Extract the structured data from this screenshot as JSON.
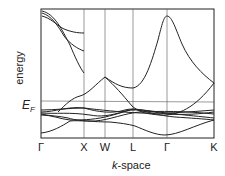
{
  "diagram": {
    "title": "",
    "y_axis_label": "energy",
    "fermi_label_main": "E",
    "fermi_label_sub": "F",
    "x_axis_label_italic": "k",
    "x_axis_label_rest": "-space",
    "k_points": [
      {
        "label": "Γ",
        "x": 41
      },
      {
        "label": "X",
        "x": 84
      },
      {
        "label": "W",
        "x": 105
      },
      {
        "label": "L",
        "x": 133
      },
      {
        "label": "Γ",
        "x": 167
      },
      {
        "label": "K",
        "x": 214
      }
    ],
    "colors": {
      "line": "#222222",
      "grid": "#555555"
    }
  }
}
